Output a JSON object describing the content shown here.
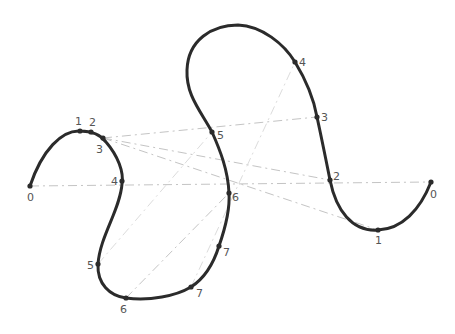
{
  "diagram": {
    "colors": {
      "curve": "#2b2b2b",
      "guide": "#c4c4c4",
      "label": "#555555"
    },
    "labels": {
      "l0": "0",
      "l1": "1",
      "l2": "2",
      "l3": "3",
      "l4": "4",
      "l5": "5",
      "l6": "6",
      "l7a": "7",
      "l7b": "7",
      "r6": "6",
      "r5": "5",
      "r4": "4",
      "r3": "3",
      "r2": "2",
      "r1": "1",
      "r0": "0"
    },
    "points": {
      "left_curve": [
        {
          "label": "0",
          "x": 30,
          "y": 186
        },
        {
          "label": "1",
          "x": 80,
          "y": 131
        },
        {
          "label": "2",
          "x": 91,
          "y": 132
        },
        {
          "label": "3",
          "x": 103,
          "y": 138
        },
        {
          "label": "4",
          "x": 122,
          "y": 181
        },
        {
          "label": "5",
          "x": 98,
          "y": 264
        },
        {
          "label": "6",
          "x": 126,
          "y": 298
        },
        {
          "label": "7",
          "x": 191,
          "y": 287
        }
      ],
      "right_curve": [
        {
          "label": "7",
          "x": 219,
          "y": 246
        },
        {
          "label": "6",
          "x": 229,
          "y": 193
        },
        {
          "label": "5",
          "x": 212,
          "y": 132
        },
        {
          "label": "4",
          "x": 295,
          "y": 62
        },
        {
          "label": "3",
          "x": 317,
          "y": 117
        },
        {
          "label": "2",
          "x": 330,
          "y": 180
        },
        {
          "label": "1",
          "x": 378,
          "y": 230
        },
        {
          "label": "0",
          "x": 431,
          "y": 182
        }
      ]
    }
  }
}
